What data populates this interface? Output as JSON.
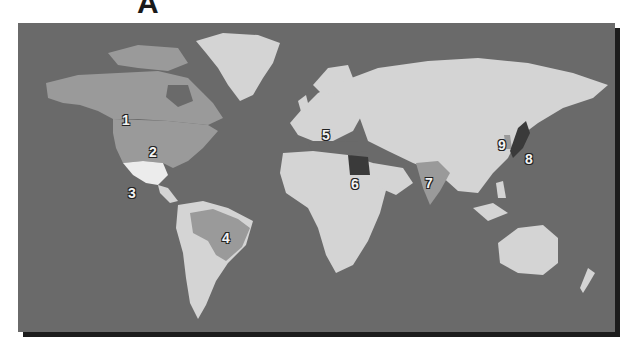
{
  "figure": {
    "panel_label": "A",
    "colors": {
      "ocean": "#6a6a6a",
      "land": "#d4d4d4",
      "highlight_mid": "#9a9a9a",
      "highlight_light": "#ececec",
      "highlight_dark": "#3a3a3a",
      "shadow": "#1c1c1c"
    }
  },
  "map": {
    "markers": [
      {
        "label": "1",
        "region": "Canada",
        "x": 104,
        "y": 89
      },
      {
        "label": "2",
        "region": "United States",
        "x": 131,
        "y": 121
      },
      {
        "label": "3",
        "region": "Mexico",
        "x": 110,
        "y": 162
      },
      {
        "label": "4",
        "region": "Brazil",
        "x": 204,
        "y": 207
      },
      {
        "label": "5",
        "region": "Europe",
        "x": 304,
        "y": 104
      },
      {
        "label": "6",
        "region": "Egypt",
        "x": 333,
        "y": 153
      },
      {
        "label": "7",
        "region": "India",
        "x": 407,
        "y": 152
      },
      {
        "label": "8",
        "region": "Japan",
        "x": 507,
        "y": 128
      },
      {
        "label": "9",
        "region": "Korea",
        "x": 480,
        "y": 114
      }
    ]
  }
}
